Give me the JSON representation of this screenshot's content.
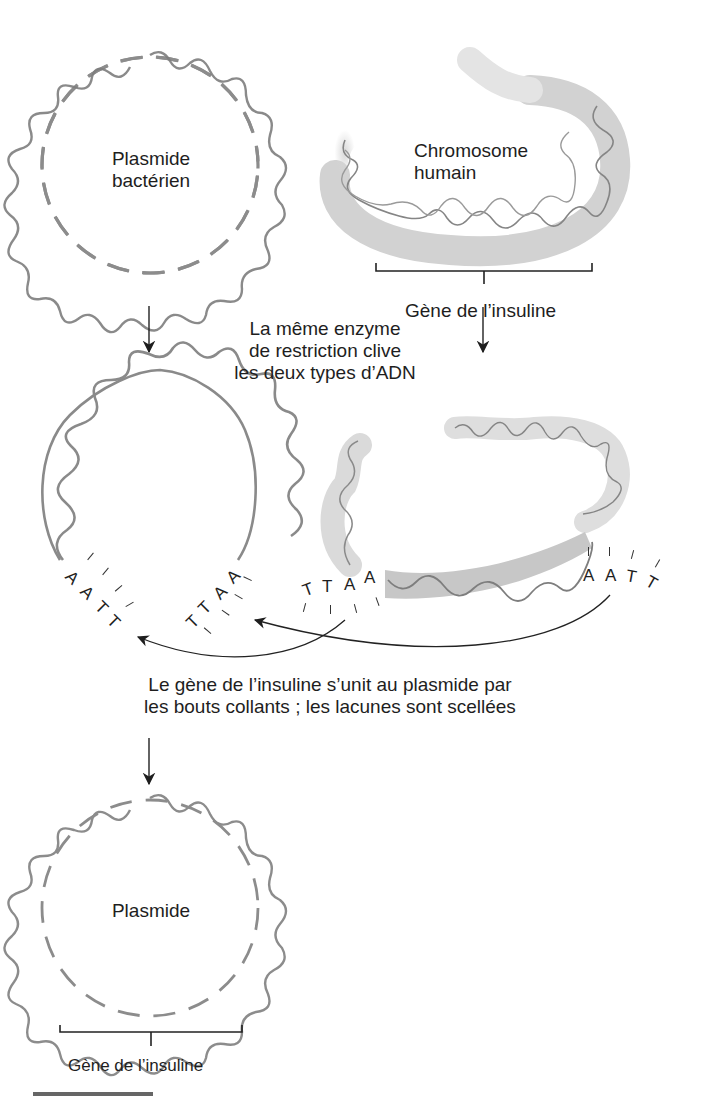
{
  "figure": {
    "steps": [
      {
        "id": "start",
        "plasmid_label_line1": "Plasmide",
        "plasmid_label_line2": "bactérien",
        "chromosome_label_line1": "Chromosome",
        "chromosome_label_line2": "humain",
        "gene_bracket_label": "Gène de l’insuline"
      },
      {
        "id": "cut",
        "enzyme_caption_line1": "La même enzyme",
        "enzyme_caption_line2": "de restriction clive",
        "enzyme_caption_line3": "les deux types d’ADN",
        "plasmid_left_end": [
          "A",
          "A",
          "T",
          "T"
        ],
        "plasmid_right_end": [
          "T",
          "T",
          "A",
          "A"
        ],
        "gene_left_end": [
          "T",
          "T",
          "A",
          "A"
        ],
        "gene_right_end": [
          "A",
          "A",
          "T",
          "T"
        ]
      },
      {
        "id": "join",
        "join_caption_line1": "Le gène de l’insuline s’unit au plasmide par",
        "join_caption_line2": "les bouts collants ; les lacunes sont scellées"
      },
      {
        "id": "result",
        "plasmid_label": "Plasmide",
        "gene_bracket_label": "Gène de l’insuline"
      }
    ],
    "colors": {
      "dna_strand": "#8a8a8a",
      "chromosome_fill": "#cfcfcf",
      "text": "#1e1e1e",
      "arrow": "#1e1e1e"
    }
  }
}
